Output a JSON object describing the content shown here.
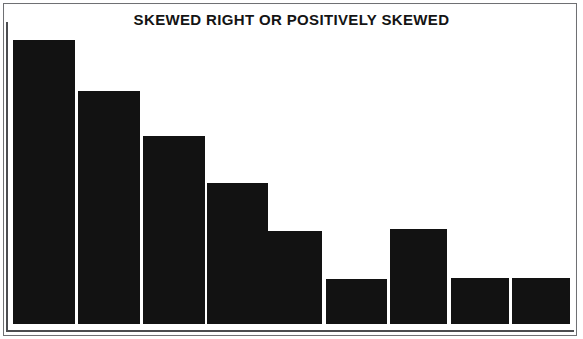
{
  "figure": {
    "title": "SKEWED RIGHT OR POSITIVELY SKEWED",
    "frame_color": "#6f7073",
    "background_color": "#ffffff",
    "bar_color": "#121212",
    "axis_color": "#4c4d50"
  },
  "chart_data": {
    "type": "bar",
    "title": "SKEWED RIGHT OR POSITIVELY SKEWED",
    "xlabel": "",
    "ylabel": "",
    "categories": [
      "1",
      "2",
      "3",
      "4",
      "5",
      "6",
      "7",
      "8",
      "9"
    ],
    "values": [
      284,
      233,
      188,
      141,
      93,
      45,
      95,
      46,
      46
    ],
    "ylim": [
      0,
      300
    ],
    "grid": false,
    "legend": false,
    "legend_position": "none",
    "tick_labels_x": [],
    "tick_labels_y": [],
    "annotations": []
  },
  "bars": [
    {
      "name": "bar-1",
      "left": 13,
      "width": 62,
      "top": 40,
      "height": 284
    },
    {
      "name": "bar-2",
      "left": 78,
      "width": 62,
      "top": 91,
      "height": 233
    },
    {
      "name": "bar-3",
      "left": 143,
      "width": 62,
      "top": 136,
      "height": 188
    },
    {
      "name": "bar-4",
      "left": 207,
      "width": 61,
      "top": 183,
      "height": 141
    },
    {
      "name": "bar-5",
      "left": 261,
      "width": 61,
      "top": 231,
      "height": 93
    },
    {
      "name": "bar-6",
      "left": 326,
      "width": 61,
      "top": 279,
      "height": 45
    },
    {
      "name": "bar-7",
      "left": 390,
      "width": 57,
      "top": 229,
      "height": 95
    },
    {
      "name": "bar-8",
      "left": 451,
      "width": 58,
      "top": 278,
      "height": 46
    },
    {
      "name": "bar-9",
      "left": 512,
      "width": 58,
      "top": 278,
      "height": 46
    }
  ]
}
